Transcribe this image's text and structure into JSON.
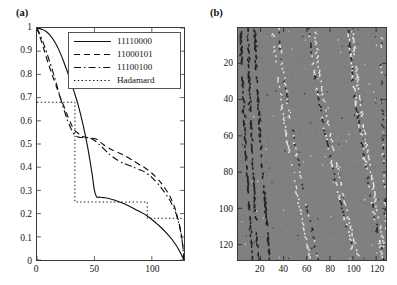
{
  "figure": {
    "panels": [
      {
        "id": "a",
        "label": "(a)"
      },
      {
        "id": "b",
        "label": "(b)"
      }
    ]
  },
  "chart_data": [
    {
      "type": "line",
      "panel": "(a)",
      "title": "",
      "xlabel": "",
      "ylabel": "",
      "xlim": [
        0,
        128
      ],
      "ylim": [
        0,
        1
      ],
      "grid": false,
      "xticks": [
        0,
        50,
        100
      ],
      "xtick_labels": [
        "0",
        "50",
        "100"
      ],
      "yticks": [
        0,
        0.1,
        0.2,
        0.3,
        0.4,
        0.5,
        0.6,
        0.7,
        0.8,
        0.9,
        1
      ],
      "ytick_labels": [
        "0",
        "0.1",
        "0.2",
        "0.3",
        "0.4",
        "0.5",
        "0.6",
        "0.7",
        "0.8",
        "0.9",
        "1"
      ],
      "legend_position": "upper right",
      "series": [
        {
          "name": "11110000",
          "style": "solid",
          "x": [
            0,
            4,
            8,
            12,
            16,
            20,
            24,
            28,
            32,
            36,
            40,
            44,
            48,
            50,
            52,
            54,
            58,
            64,
            72,
            80,
            88,
            96,
            104,
            112,
            120,
            126,
            128
          ],
          "values": [
            1.0,
            0.995,
            0.985,
            0.965,
            0.935,
            0.895,
            0.845,
            0.79,
            0.73,
            0.665,
            0.585,
            0.49,
            0.37,
            0.3,
            0.272,
            0.271,
            0.269,
            0.263,
            0.25,
            0.233,
            0.212,
            0.19,
            0.158,
            0.12,
            0.072,
            0.02,
            0.0
          ]
        },
        {
          "name": "11000101",
          "style": "dashed",
          "x": [
            0,
            4,
            8,
            12,
            16,
            20,
            24,
            28,
            32,
            36,
            40,
            44,
            48,
            52,
            56,
            60,
            64,
            68,
            72,
            80,
            88,
            96,
            104,
            112,
            118,
            122,
            126,
            128
          ],
          "values": [
            1.0,
            0.94,
            0.875,
            0.815,
            0.76,
            0.705,
            0.655,
            0.605,
            0.565,
            0.545,
            0.532,
            0.528,
            0.525,
            0.52,
            0.505,
            0.49,
            0.478,
            0.468,
            0.46,
            0.44,
            0.415,
            0.39,
            0.355,
            0.305,
            0.25,
            0.19,
            0.1,
            0.0
          ]
        },
        {
          "name": "11100100",
          "style": "dashdot",
          "x": [
            0,
            4,
            8,
            12,
            16,
            20,
            24,
            28,
            32,
            36,
            40,
            44,
            48,
            52,
            56,
            60,
            64,
            72,
            80,
            88,
            96,
            104,
            112,
            118,
            122,
            126,
            128
          ],
          "values": [
            1.0,
            0.955,
            0.9,
            0.84,
            0.775,
            0.705,
            0.64,
            0.585,
            0.545,
            0.53,
            0.528,
            0.527,
            0.522,
            0.508,
            0.49,
            0.47,
            0.452,
            0.425,
            0.408,
            0.392,
            0.372,
            0.335,
            0.285,
            0.235,
            0.185,
            0.095,
            0.0
          ]
        },
        {
          "name": "Hadamard",
          "style": "dotted",
          "step": true,
          "x": [
            0,
            33,
            33,
            96,
            96,
            128
          ],
          "values": [
            0.68,
            0.68,
            0.25,
            0.25,
            0.18,
            0.18
          ]
        }
      ]
    },
    {
      "type": "heatmap",
      "panel": "(b)",
      "title": "",
      "xlabel": "",
      "ylabel": "",
      "xlim": [
        1,
        128
      ],
      "ylim": [
        1,
        128
      ],
      "y_inverted": true,
      "grid": false,
      "xticks": [
        20,
        40,
        60,
        80,
        100,
        120
      ],
      "xtick_labels": [
        "20",
        "40",
        "60",
        "80",
        "100",
        "120"
      ],
      "yticks": [
        20,
        40,
        60,
        80,
        100,
        120
      ],
      "ytick_labels": [
        "20",
        "40",
        "60",
        "80",
        "100",
        "120"
      ],
      "background_color": "#808080",
      "dark_color": "#1c1c1c",
      "light_color": "#f0f0f0",
      "description": "128x128 correlation matrix: mid-gray background with curved diagonal streaks of dark and light cells"
    }
  ]
}
